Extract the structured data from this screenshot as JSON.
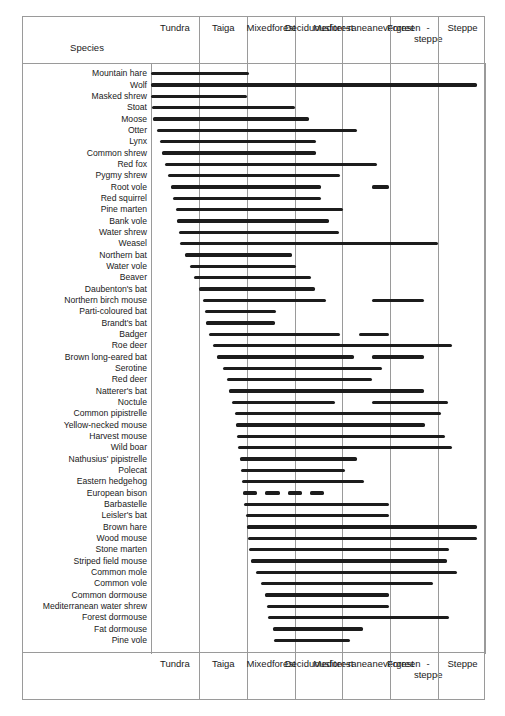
{
  "chart_data": {
    "type": "bar",
    "title": "",
    "xlabel": "",
    "ylabel": "Species",
    "orientation": "horizontal",
    "grid": true,
    "legend": false,
    "note": "Range chart: each species' horizontal bar spans the biome zones it occupies, from column 1 (Tundra) through column 7 (Steppe). Values are fractional column positions 0-7 along the biome gradient; disjoint segments indicate separated occurrences.",
    "categories": [
      "Tundra",
      "Taiga",
      "Mixed forest",
      "Deciduous forest",
      "Mediterranean evergreen",
      "Forest-steppe",
      "Steppe"
    ],
    "xlim": [
      0,
      7
    ],
    "species": [
      {
        "name": "Mountain hare",
        "segments": [
          [
            0.0,
            2.05
          ]
        ]
      },
      {
        "name": "Wolf",
        "segments": [
          [
            0.0,
            6.82
          ]
        ]
      },
      {
        "name": "Masked shrew",
        "segments": [
          [
            0.0,
            2.0
          ]
        ]
      },
      {
        "name": "Stoat",
        "segments": [
          [
            0.02,
            3.0
          ]
        ]
      },
      {
        "name": "Moose",
        "segments": [
          [
            0.05,
            3.3
          ]
        ]
      },
      {
        "name": "Otter",
        "segments": [
          [
            0.12,
            4.3
          ]
        ]
      },
      {
        "name": "Lynx",
        "segments": [
          [
            0.18,
            3.45
          ]
        ]
      },
      {
        "name": "Common shrew",
        "segments": [
          [
            0.22,
            3.45
          ]
        ]
      },
      {
        "name": "Red fox",
        "segments": [
          [
            0.3,
            4.72
          ]
        ]
      },
      {
        "name": "Pygmy shrew",
        "segments": [
          [
            0.35,
            3.95
          ]
        ]
      },
      {
        "name": "Root vole",
        "segments": [
          [
            0.42,
            3.55
          ],
          [
            4.62,
            4.98
          ]
        ]
      },
      {
        "name": "Red squirrel",
        "segments": [
          [
            0.45,
            3.55
          ]
        ]
      },
      {
        "name": "Pine marten",
        "segments": [
          [
            0.52,
            4.02
          ]
        ]
      },
      {
        "name": "Bank vole",
        "segments": [
          [
            0.55,
            3.72
          ]
        ]
      },
      {
        "name": "Water shrew",
        "segments": [
          [
            0.58,
            3.92
          ]
        ]
      },
      {
        "name": "Weasel",
        "segments": [
          [
            0.6,
            6.0
          ]
        ]
      },
      {
        "name": "Northern bat",
        "segments": [
          [
            0.72,
            2.95
          ]
        ]
      },
      {
        "name": "Water vole",
        "segments": [
          [
            0.82,
            3.02
          ]
        ]
      },
      {
        "name": "Beaver",
        "segments": [
          [
            0.9,
            3.35
          ]
        ]
      },
      {
        "name": "Daubenton's bat",
        "segments": [
          [
            1.0,
            3.42
          ]
        ]
      },
      {
        "name": "Northern birch mouse",
        "segments": [
          [
            1.08,
            3.65
          ],
          [
            4.62,
            5.7
          ]
        ]
      },
      {
        "name": "Parti-coloured bat",
        "segments": [
          [
            1.12,
            2.62
          ]
        ]
      },
      {
        "name": "Brandt's bat",
        "segments": [
          [
            1.15,
            2.6
          ]
        ]
      },
      {
        "name": "Badger",
        "segments": [
          [
            1.22,
            3.95
          ],
          [
            4.35,
            4.98
          ]
        ]
      },
      {
        "name": "Roe deer",
        "segments": [
          [
            1.3,
            6.3
          ]
        ]
      },
      {
        "name": "Brown long-eared bat",
        "segments": [
          [
            1.38,
            4.25
          ],
          [
            4.62,
            5.7
          ]
        ]
      },
      {
        "name": "Serotine",
        "segments": [
          [
            1.5,
            4.82
          ]
        ]
      },
      {
        "name": "Red deer",
        "segments": [
          [
            1.58,
            4.62
          ]
        ]
      },
      {
        "name": "Natterer's bat",
        "segments": [
          [
            1.62,
            5.7
          ]
        ]
      },
      {
        "name": "Noctule",
        "segments": [
          [
            1.7,
            3.85
          ],
          [
            4.62,
            6.2
          ]
        ]
      },
      {
        "name": "Common pipistrelle",
        "segments": [
          [
            1.75,
            6.05
          ]
        ]
      },
      {
        "name": "Yellow-necked mouse",
        "segments": [
          [
            1.78,
            5.72
          ]
        ]
      },
      {
        "name": "Harvest mouse",
        "segments": [
          [
            1.8,
            6.15
          ]
        ]
      },
      {
        "name": "Wild boar",
        "segments": [
          [
            1.82,
            6.3
          ]
        ]
      },
      {
        "name": "Nathusius' pipistrelle",
        "segments": [
          [
            1.85,
            4.3
          ]
        ]
      },
      {
        "name": "Polecat",
        "segments": [
          [
            1.88,
            4.05
          ]
        ]
      },
      {
        "name": "Eastern hedgehog",
        "segments": [
          [
            1.9,
            4.45
          ]
        ]
      },
      {
        "name": "European bison",
        "segments": [
          [
            1.92,
            3.62
          ]
        ],
        "style": "dashed"
      },
      {
        "name": "Barbastelle",
        "segments": [
          [
            1.95,
            4.98
          ]
        ]
      },
      {
        "name": "Leisler's bat",
        "segments": [
          [
            1.98,
            4.98
          ]
        ]
      },
      {
        "name": "Brown hare",
        "segments": [
          [
            2.0,
            6.82
          ]
        ]
      },
      {
        "name": "Wood mouse",
        "segments": [
          [
            2.02,
            6.82
          ]
        ]
      },
      {
        "name": "Stone marten",
        "segments": [
          [
            2.05,
            6.22
          ]
        ]
      },
      {
        "name": "Striped field mouse",
        "segments": [
          [
            2.08,
            6.18
          ]
        ]
      },
      {
        "name": "Common mole",
        "segments": [
          [
            2.2,
            6.4
          ]
        ]
      },
      {
        "name": "Common vole",
        "segments": [
          [
            2.3,
            5.9
          ]
        ]
      },
      {
        "name": "Common dormouse",
        "segments": [
          [
            2.38,
            4.98
          ]
        ]
      },
      {
        "name": "Mediterranean water shrew",
        "segments": [
          [
            2.42,
            4.98
          ]
        ]
      },
      {
        "name": "Forest dormouse",
        "segments": [
          [
            2.45,
            6.22
          ]
        ]
      },
      {
        "name": "Fat dormouse",
        "segments": [
          [
            2.55,
            4.42
          ]
        ]
      },
      {
        "name": "Pine vole",
        "segments": [
          [
            2.58,
            4.15
          ]
        ]
      }
    ]
  },
  "header": {
    "species_label": "Species",
    "columns": [
      {
        "lines": [
          "Tundra"
        ]
      },
      {
        "lines": [
          "Taiga"
        ]
      },
      {
        "lines": [
          "Mixed",
          "forest"
        ]
      },
      {
        "lines": [
          "Deciduous",
          "forest"
        ]
      },
      {
        "lines": [
          "Mediter-",
          "ranean",
          "evergreen"
        ]
      },
      {
        "lines": [
          "Forest",
          "-steppe"
        ]
      },
      {
        "lines": [
          "Steppe"
        ]
      }
    ]
  },
  "footer": {
    "species_label": "",
    "columns": [
      {
        "lines": [
          "Tundra"
        ]
      },
      {
        "lines": [
          "Taiga"
        ]
      },
      {
        "lines": [
          "Mixed",
          "forest"
        ]
      },
      {
        "lines": [
          "Deciduous",
          "forest"
        ]
      },
      {
        "lines": [
          "Mediter-",
          "ranean",
          "evergreen"
        ]
      },
      {
        "lines": [
          "Forest",
          "-steppe"
        ]
      },
      {
        "lines": [
          "Steppe"
        ]
      }
    ]
  },
  "style": {
    "bar_color": "#1c1c1c",
    "grid_color": "#9a9a9a",
    "background": "#ffffff",
    "text_color": "#1a1a1a"
  }
}
